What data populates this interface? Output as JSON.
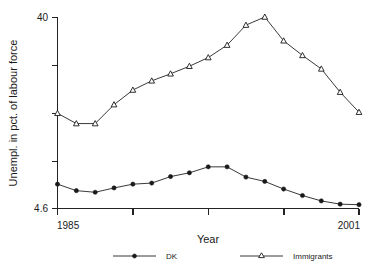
{
  "chart_data": {
    "type": "line",
    "title": "",
    "subtitle": "",
    "xlabel": "Year",
    "ylabel": "Unempl. in pct. of labour force",
    "x": [
      1985,
      1986,
      1987,
      1988,
      1989,
      1990,
      1991,
      1992,
      1993,
      1994,
      1995,
      1996,
      1997,
      1998,
      1999,
      2000,
      2001
    ],
    "xlim": [
      1985,
      2001
    ],
    "ylim": [
      4.6,
      40
    ],
    "xticks": [
      1985,
      1989,
      1993,
      1997,
      2001
    ],
    "xtick_labels": [
      "1985",
      "",
      "",
      "",
      "2001"
    ],
    "yticks": [
      4.6,
      13.45,
      22.3,
      31.15,
      40
    ],
    "ytick_labels": [
      "4.6",
      "",
      "",
      "",
      "40"
    ],
    "grid": false,
    "legend_position": "bottom",
    "series": [
      {
        "name": "DK",
        "marker": "filled-circle",
        "values": [
          9.1,
          7.9,
          7.6,
          8.4,
          9.1,
          9.3,
          10.5,
          11.2,
          12.3,
          12.3,
          10.4,
          9.6,
          8.2,
          7.0,
          6.0,
          5.4,
          5.3
        ]
      },
      {
        "name": "Immigrants",
        "marker": "open-triangle",
        "values": [
          22.2,
          20.3,
          20.3,
          23.8,
          26.5,
          28.2,
          29.5,
          30.9,
          32.5,
          34.8,
          38.5,
          40.0,
          35.6,
          32.9,
          30.4,
          26.1,
          22.4
        ]
      }
    ]
  },
  "axes": {
    "y_top_label": "40",
    "y_bottom_label": "4.6",
    "x_left_label": "1985",
    "x_right_label": "2001",
    "x_title": "Year",
    "y_title": "Unempl. in pct. of labour force"
  },
  "legend": {
    "entries": [
      {
        "label": "DK",
        "marker": "filled-circle-marker"
      },
      {
        "label": "Immigrants",
        "marker": "open-triangle-marker"
      }
    ]
  },
  "colors": {
    "ink": "#222222",
    "background": "#ffffff"
  }
}
